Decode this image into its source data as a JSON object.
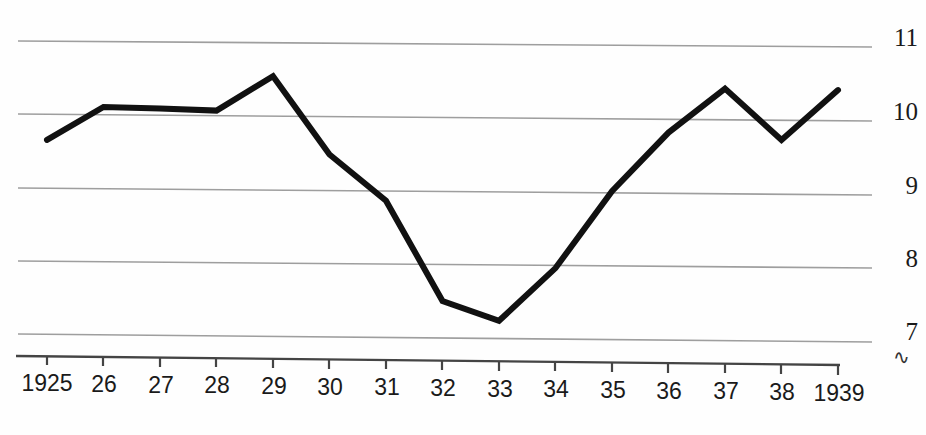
{
  "chart_data": {
    "type": "line",
    "title": "",
    "subtitle": "",
    "xlabel": "",
    "ylabel": "",
    "x": [
      1925,
      1926,
      1927,
      1928,
      1929,
      1930,
      1931,
      1932,
      1933,
      1934,
      1935,
      1936,
      1937,
      1938,
      1939
    ],
    "categories": [
      "1925",
      "26",
      "27",
      "28",
      "29",
      "30",
      "31",
      "32",
      "33",
      "34",
      "35",
      "36",
      "37",
      "38",
      "1939"
    ],
    "values": [
      9.65,
      10.1,
      10.08,
      10.05,
      10.52,
      9.45,
      8.82,
      7.45,
      7.18,
      7.9,
      8.95,
      9.75,
      10.35,
      9.65,
      10.33
    ],
    "series": [
      {
        "name": "series-1",
        "values": [
          9.65,
          10.1,
          10.08,
          10.05,
          10.52,
          9.45,
          8.82,
          7.45,
          7.18,
          7.9,
          8.95,
          9.75,
          10.35,
          9.65,
          10.33
        ]
      }
    ],
    "ylim": [
      6.8,
      11.3
    ],
    "xlim": [
      1925,
      1939
    ],
    "yticks": [
      7,
      8,
      9,
      10,
      11
    ],
    "ytick_labels": [
      "7",
      "8",
      "9",
      "10",
      "11"
    ],
    "xtick_labels": [
      "1925",
      "26",
      "27",
      "28",
      "29",
      "30",
      "31",
      "32",
      "33",
      "34",
      "35",
      "36",
      "37",
      "38",
      "1939"
    ],
    "grid": true,
    "grid_axis": "y",
    "legend": false,
    "legend_position": "none",
    "line_color": "#111111",
    "line_width": 6,
    "grid_color": "#9a9a9a",
    "axis_color": "#3a3a3a",
    "background": "#fefefe",
    "annotations": [
      {
        "name": "axis-break",
        "symbol": "∿",
        "position": "below-y-axis-bottom"
      }
    ]
  },
  "axis": {
    "y_labels": [
      "11",
      "10",
      "9",
      "8",
      "7"
    ],
    "x_labels": [
      "1925",
      "26",
      "27",
      "28",
      "29",
      "30",
      "31",
      "32",
      "33",
      "34",
      "35",
      "36",
      "37",
      "38",
      "1939"
    ],
    "break_symbol": "∿"
  }
}
